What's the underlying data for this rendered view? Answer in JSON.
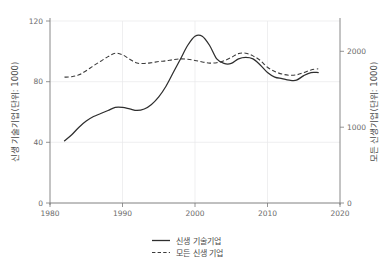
{
  "chart_data": {
    "type": "line",
    "title": "",
    "xlabel": "",
    "ylabel": "신생 기술기업(단위: 1000)",
    "y2label": "모든 신생기업(단위: 1000)",
    "xlim": [
      1980,
      2020
    ],
    "ylim": [
      0,
      120
    ],
    "y2lim": [
      0,
      2400
    ],
    "xticks": [
      1980,
      1990,
      2000,
      2010,
      2020
    ],
    "xticklabels": [
      "1980",
      "1990",
      "2000",
      "2010",
      "2020"
    ],
    "yticks": [
      0,
      40,
      80,
      120
    ],
    "yticklabels": [
      "0",
      "40",
      "80",
      "120"
    ],
    "y2ticks": [
      0,
      1000,
      2000
    ],
    "y2ticklabels": [
      "0",
      "1000",
      "2000"
    ],
    "grid": true,
    "legend_position": "bottom",
    "series": [
      {
        "name": "신생 기술기업",
        "style": "solid",
        "axis": "left",
        "color": "#2e2e2e",
        "x": [
          1982,
          1983,
          1984,
          1985,
          1986,
          1987,
          1988,
          1989,
          1990,
          1991,
          1992,
          1993,
          1994,
          1995,
          1996,
          1997,
          1998,
          1999,
          2000,
          2001,
          2002,
          2003,
          2004,
          2005,
          2006,
          2007,
          2008,
          2009,
          2010,
          2011,
          2012,
          2013,
          2014,
          2015,
          2016,
          2017
        ],
        "values": [
          41,
          45,
          50,
          54,
          57,
          59,
          61,
          63,
          63,
          62,
          61,
          62,
          65,
          70,
          77,
          86,
          95,
          104,
          110,
          110,
          104,
          95,
          92,
          92,
          95,
          96,
          95,
          91,
          86,
          83,
          82,
          81,
          81,
          84,
          86,
          86
        ]
      },
      {
        "name": "모든 신생 기업",
        "style": "dashed",
        "axis": "right",
        "color": "#3c3c3c",
        "x": [
          1982,
          1983,
          1984,
          1985,
          1986,
          1987,
          1988,
          1989,
          1990,
          1991,
          1992,
          1993,
          1994,
          1995,
          1996,
          1997,
          1998,
          1999,
          2000,
          2001,
          2002,
          2003,
          2004,
          2005,
          2006,
          2007,
          2008,
          2009,
          2010,
          2011,
          2012,
          2013,
          2014,
          2015,
          2016,
          2017
        ],
        "values_right": [
          1660,
          1665,
          1690,
          1745,
          1810,
          1870,
          1930,
          1975,
          1955,
          1895,
          1845,
          1840,
          1850,
          1865,
          1875,
          1890,
          1900,
          1895,
          1880,
          1860,
          1845,
          1850,
          1875,
          1920,
          1970,
          1975,
          1940,
          1880,
          1790,
          1735,
          1700,
          1685,
          1690,
          1720,
          1755,
          1770
        ]
      }
    ],
    "legend": [
      {
        "label": "신생 기술기업",
        "style": "solid"
      },
      {
        "label": "모든 신생 기업",
        "style": "dashed"
      }
    ]
  }
}
